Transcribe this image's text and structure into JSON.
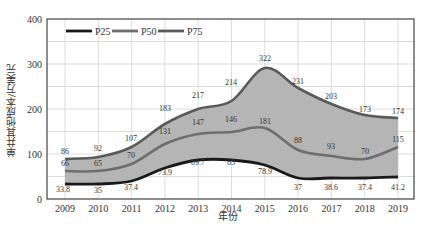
{
  "chart_data": {
    "type": "area",
    "title": "",
    "xlabel": "年份",
    "ylabel": "单井其他成本/万美元",
    "ylim": [
      0,
      400
    ],
    "yticks": [
      0,
      100,
      200,
      300,
      400
    ],
    "grid": true,
    "legend_position": "top-left",
    "categories": [
      "2009",
      "2010",
      "2011",
      "2012",
      "2013",
      "2014",
      "2015",
      "2016",
      "2017",
      "2018",
      "2019"
    ],
    "series": [
      {
        "name": "P25",
        "color": "#1a1a1a",
        "values": [
          33.8,
          35,
          37.4,
          73.9,
          89.7,
          85,
          78.9,
          37,
          38.6,
          37.4,
          41.2
        ]
      },
      {
        "name": "P50",
        "color": "#6e6e6e",
        "values": [
          66,
          65,
          70,
          131,
          147,
          146,
          181,
          88,
          93,
          70,
          115
        ]
      },
      {
        "name": "P75",
        "color": "#5a5a5a",
        "values": [
          86,
          92,
          107,
          183,
          217,
          214,
          322,
          231,
          203,
          173,
          174
        ]
      }
    ],
    "band_fill": "#b5b5b5"
  },
  "legend": [
    {
      "label": "P25"
    },
    {
      "label": "P50"
    },
    {
      "label": "P75"
    }
  ],
  "axes": {
    "ytick_labels": [
      "0",
      "100",
      "200",
      "300",
      "400"
    ],
    "xtick_labels": [
      "2009",
      "2010",
      "2011",
      "2012",
      "2013",
      "2014",
      "2015",
      "2016",
      "2017",
      "2018",
      "2019"
    ]
  }
}
